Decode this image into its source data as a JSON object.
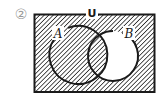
{
  "problem": {
    "number_label": "②"
  },
  "diagram": {
    "type": "venn",
    "universe_label": "U",
    "sets": [
      {
        "name": "A",
        "label": "A",
        "cx": 78,
        "cy": 55,
        "r": 29
      },
      {
        "name": "B",
        "label": "B",
        "cx": 113,
        "cy": 56,
        "r": 25
      }
    ],
    "shaded_region": "(B ∩ A')'  = A ∪ B'",
    "unshaded_region": "B − A",
    "colors": {
      "stroke": "#1a1a1a",
      "hatch": "#2a2a2a",
      "background": "#ffffff",
      "number": "#9a9a9a"
    }
  }
}
